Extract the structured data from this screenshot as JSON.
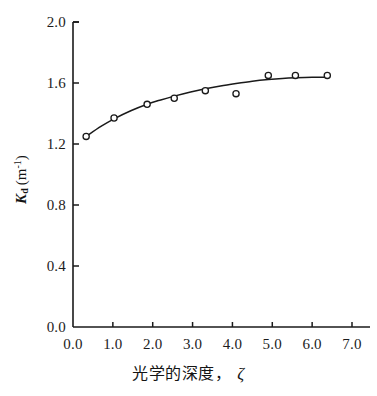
{
  "chart_data": {
    "type": "scatter",
    "title": "",
    "subtitle": "",
    "xlabel": "光学的深度，ζ",
    "ylabel": "Kd (m-1)",
    "ylabel_parts": {
      "symbol": "K",
      "subscript": "d",
      "unit_open": "(m",
      "unit_exp": "-1",
      "unit_close": ")"
    },
    "xlabel_parts": {
      "text": "光学的深度，",
      "symbol": "ζ"
    },
    "xlim": [
      0.0,
      7.0
    ],
    "ylim": [
      0.0,
      2.0
    ],
    "xticks": [
      0.0,
      1.0,
      2.0,
      3.0,
      4.0,
      5.0,
      6.0,
      7.0
    ],
    "yticks": [
      0.0,
      0.4,
      0.8,
      1.2,
      1.6,
      2.0
    ],
    "xtick_labels": [
      "0.0",
      "1.0",
      "2.0",
      "3.0",
      "4.0",
      "5.0",
      "6.0",
      "7.0"
    ],
    "ytick_labels": [
      "0.0",
      "0.4",
      "0.8",
      "1.2",
      "1.6",
      "2.0"
    ],
    "grid": false,
    "legend": null,
    "axis_color": "#1a1a1a",
    "marker_color": "#1a1a1a",
    "marker_fill": "#ffffff",
    "line_color": "#1a1a1a",
    "background": "#ffffff",
    "series": [
      {
        "name": "Kd vs optical depth",
        "marker": "open-circle",
        "x": [
          0.33,
          1.03,
          1.86,
          2.54,
          3.32,
          4.09,
          4.9,
          5.58,
          6.38
        ],
        "y": [
          1.25,
          1.37,
          1.46,
          1.5,
          1.55,
          1.53,
          1.65,
          1.65,
          1.65
        ]
      },
      {
        "name": "fitted curve",
        "marker": "none",
        "x": [
          0.33,
          0.7,
          1.03,
          1.45,
          1.86,
          2.2,
          2.54,
          2.95,
          3.32,
          3.7,
          4.09,
          4.5,
          4.9,
          5.25,
          5.58,
          6.0,
          6.38
        ],
        "y": [
          1.25,
          1.315,
          1.365,
          1.418,
          1.461,
          1.489,
          1.514,
          1.541,
          1.562,
          1.581,
          1.597,
          1.612,
          1.623,
          1.63,
          1.634,
          1.637,
          1.638
        ]
      }
    ]
  }
}
